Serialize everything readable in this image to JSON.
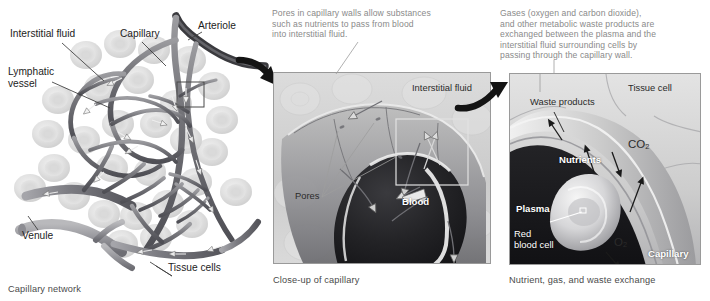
{
  "figure": {
    "background": "#ffffff"
  },
  "colors": {
    "callout_text": "#8a8a8a",
    "caption_text": "#4a4a4a",
    "label_text": "#1c1c1c",
    "leader_line": "#3a3a3a",
    "panel_border": "#9a9a9a",
    "blood_dark": "#262628",
    "vessel_gray": "#6f6f72",
    "tissue_gray": "#d6d6d6"
  },
  "left_panel": {
    "caption": "Capillary network",
    "labels": [
      {
        "id": "interstitial-fluid",
        "text": "Interstitial fluid"
      },
      {
        "id": "capillary",
        "text": "Capillary"
      },
      {
        "id": "arteriole",
        "text": "Arteriole"
      },
      {
        "id": "lymphatic-vessel",
        "text": "Lymphatic\nvessel"
      },
      {
        "id": "venule",
        "text": "Venule"
      },
      {
        "id": "tissue-cells",
        "text": "Tissue cells"
      }
    ]
  },
  "middle_panel": {
    "callout": "Pores in capillary walls allow substances\nsuch as nutrients to pass from blood\ninto interstitial fluid.",
    "caption": "Close-up of capillary",
    "labels": [
      {
        "id": "interstitial-fluid",
        "text": "Interstitial fluid"
      },
      {
        "id": "pores",
        "text": "Pores"
      },
      {
        "id": "blood",
        "text": "Blood"
      }
    ]
  },
  "right_panel": {
    "callout": "Gases (oxygen and carbon dioxide),\nand other metabolic waste products are\nexchanged between the plasma and the\ninterstitial fluid surrounding cells by\npassing through the capillary wall.",
    "caption": "Nutrient, gas, and waste exchange",
    "labels": [
      {
        "id": "tissue-cell",
        "text": "Tissue cell"
      },
      {
        "id": "waste-products",
        "text": "Waste products"
      },
      {
        "id": "carbon-dioxide",
        "text": "CO",
        "subscript": "2"
      },
      {
        "id": "nutrients",
        "text": "Nutrients"
      },
      {
        "id": "plasma",
        "text": "Plasma"
      },
      {
        "id": "red-blood-cell",
        "text": "Red\nblood cell"
      },
      {
        "id": "oxygen",
        "text": "O",
        "subscript": "2"
      },
      {
        "id": "capillary",
        "text": "Capillary"
      }
    ]
  }
}
